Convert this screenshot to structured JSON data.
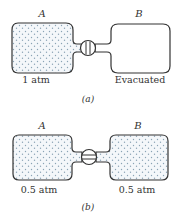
{
  "panel_a": {
    "container_a": {
      "label": "A",
      "pressure": "1 atm",
      "filled": true
    },
    "container_b": {
      "label": "B",
      "pressure": "Evacuated",
      "filled": false
    },
    "valve_state": "closed",
    "caption": "(a)"
  },
  "panel_b": {
    "container_a": {
      "label": "A",
      "pressure": "0.5 atm",
      "filled": true
    },
    "container_b": {
      "label": "B",
      "pressure": "0.5 atm",
      "filled": true
    },
    "valve_state": "open",
    "caption": "(b)"
  },
  "colors": {
    "outline": "#333333",
    "dots": "#8aa3b5",
    "fill": "#f4f7fa"
  }
}
